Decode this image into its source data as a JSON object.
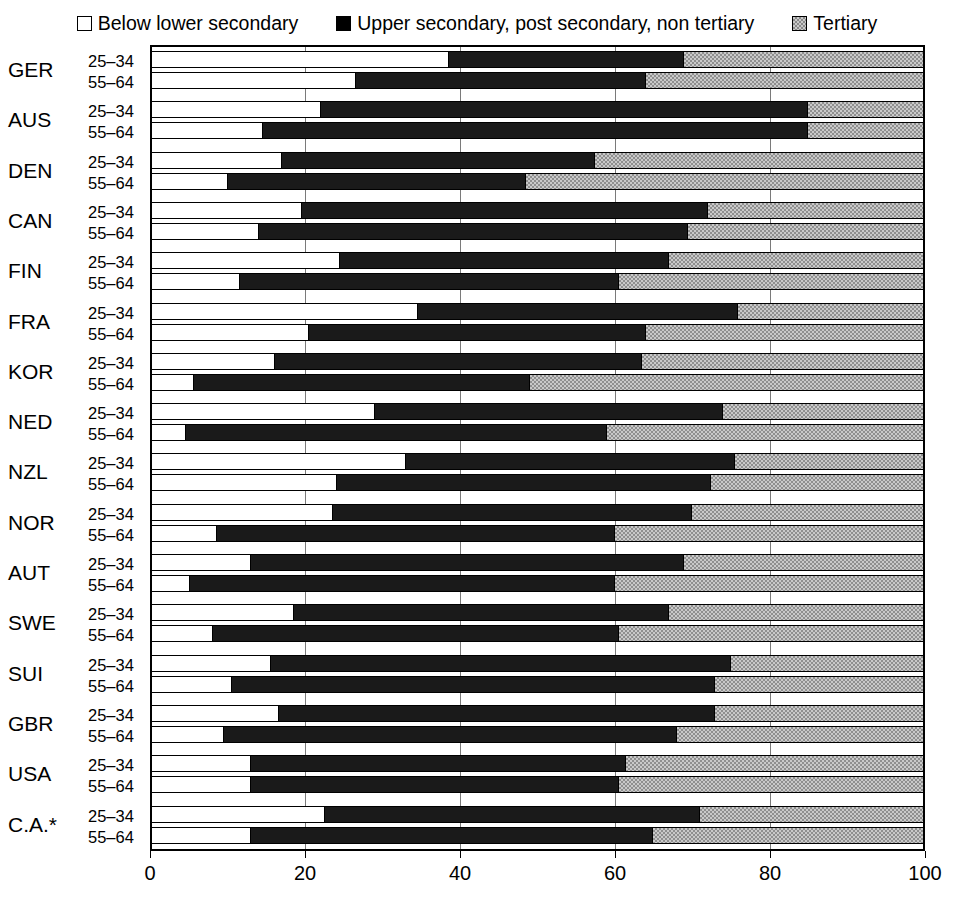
{
  "legend": {
    "items": [
      {
        "label": "Below lower secondary",
        "swatch": "open-square-swatch",
        "color": "#ffffff"
      },
      {
        "label": "Upper secondary, post secondary, non tertiary",
        "swatch": "filled-square-swatch",
        "color": "#000000"
      },
      {
        "label": "Tertiary",
        "swatch": "hatched-square-swatch",
        "color": "#c9c9c9"
      }
    ]
  },
  "axis": {
    "x_ticks": [
      "0",
      "20",
      "40",
      "60",
      "80",
      "100"
    ],
    "x_min": 0,
    "x_max": 100
  },
  "age_groups": [
    "25–34",
    "55–64"
  ],
  "footnote": "",
  "chart_data": {
    "type": "bar",
    "orientation": "horizontal",
    "stacked": true,
    "stack_total": 100,
    "title": "",
    "xlabel": "",
    "ylabel": "",
    "xlim": [
      0,
      100
    ],
    "grid": true,
    "grid_axis": "x",
    "legend_position": "top",
    "categories": [
      "GER",
      "AUS",
      "DEN",
      "CAN",
      "FIN",
      "FRA",
      "KOR",
      "NED",
      "NZL",
      "NOR",
      "AUT",
      "SWE",
      "SUI",
      "GBR",
      "USA",
      "C.A.*"
    ],
    "subcategories": [
      "25–34",
      "55–64"
    ],
    "series": [
      {
        "name": "Below lower secondary",
        "color": "#ffffff"
      },
      {
        "name": "Upper secondary, post secondary, non tertiary",
        "color": "#000000"
      },
      {
        "name": "Tertiary",
        "color": "#c9c9c9"
      }
    ],
    "groups": [
      {
        "category": "GER",
        "rows": [
          {
            "age": "25–34",
            "values": [
              38.5,
              30.5,
              31.0
            ]
          },
          {
            "age": "55–64",
            "values": [
              26.5,
              37.5,
              36.0
            ]
          }
        ]
      },
      {
        "category": "AUS",
        "rows": [
          {
            "age": "25–34",
            "values": [
              22.0,
              63.0,
              15.0
            ]
          },
          {
            "age": "55–64",
            "values": [
              14.5,
              70.5,
              15.0
            ]
          }
        ]
      },
      {
        "category": "DEN",
        "rows": [
          {
            "age": "25–34",
            "values": [
              17.0,
              40.5,
              42.5
            ]
          },
          {
            "age": "55–64",
            "values": [
              10.0,
              38.5,
              51.5
            ]
          }
        ]
      },
      {
        "category": "CAN",
        "rows": [
          {
            "age": "25–34",
            "values": [
              19.5,
              52.5,
              28.0
            ]
          },
          {
            "age": "55–64",
            "values": [
              14.0,
              55.5,
              30.5
            ]
          }
        ]
      },
      {
        "category": "FIN",
        "rows": [
          {
            "age": "25–34",
            "values": [
              24.5,
              42.5,
              33.0
            ]
          },
          {
            "age": "55–64",
            "values": [
              11.5,
              49.0,
              39.5
            ]
          }
        ]
      },
      {
        "category": "FRA",
        "rows": [
          {
            "age": "25–34",
            "values": [
              34.5,
              41.5,
              24.0
            ]
          },
          {
            "age": "55–64",
            "values": [
              20.5,
              43.5,
              36.0
            ]
          }
        ]
      },
      {
        "category": "KOR",
        "rows": [
          {
            "age": "25–34",
            "values": [
              16.0,
              47.5,
              36.5
            ]
          },
          {
            "age": "55–64",
            "values": [
              5.5,
              43.5,
              51.0
            ]
          }
        ]
      },
      {
        "category": "NED",
        "rows": [
          {
            "age": "25–34",
            "values": [
              29.0,
              45.0,
              26.0
            ]
          },
          {
            "age": "55–64",
            "values": [
              4.5,
              54.5,
              41.0
            ]
          }
        ]
      },
      {
        "category": "NZL",
        "rows": [
          {
            "age": "25–34",
            "values": [
              33.0,
              42.5,
              24.5
            ]
          },
          {
            "age": "55–64",
            "values": [
              24.0,
              48.5,
              27.5
            ]
          }
        ]
      },
      {
        "category": "NOR",
        "rows": [
          {
            "age": "25–34",
            "values": [
              23.5,
              46.5,
              30.0
            ]
          },
          {
            "age": "55–64",
            "values": [
              8.5,
              51.5,
              40.0
            ]
          }
        ]
      },
      {
        "category": "AUT",
        "rows": [
          {
            "age": "25–34",
            "values": [
              13.0,
              56.0,
              31.0
            ]
          },
          {
            "age": "55–64",
            "values": [
              5.0,
              55.0,
              40.0
            ]
          }
        ]
      },
      {
        "category": "SWE",
        "rows": [
          {
            "age": "25–34",
            "values": [
              18.5,
              48.5,
              33.0
            ]
          },
          {
            "age": "55–64",
            "values": [
              8.0,
              52.5,
              39.5
            ]
          }
        ]
      },
      {
        "category": "SUI",
        "rows": [
          {
            "age": "25–34",
            "values": [
              15.5,
              59.5,
              25.0
            ]
          },
          {
            "age": "55–64",
            "values": [
              10.5,
              62.5,
              27.0
            ]
          }
        ]
      },
      {
        "category": "GBR",
        "rows": [
          {
            "age": "25–34",
            "values": [
              16.5,
              56.5,
              27.0
            ]
          },
          {
            "age": "55–64",
            "values": [
              9.5,
              58.5,
              32.0
            ]
          }
        ]
      },
      {
        "category": "USA",
        "rows": [
          {
            "age": "25–34",
            "values": [
              13.0,
              48.5,
              38.5
            ]
          },
          {
            "age": "55–64",
            "values": [
              13.0,
              47.5,
              39.5
            ]
          }
        ]
      },
      {
        "category": "C.A.*",
        "rows": [
          {
            "age": "25–34",
            "values": [
              22.5,
              48.5,
              29.0
            ]
          },
          {
            "age": "55–64",
            "values": [
              13.0,
              52.0,
              35.0
            ]
          }
        ]
      }
    ]
  }
}
